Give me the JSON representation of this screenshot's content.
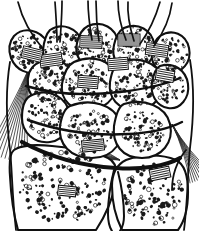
{
  "figure": {
    "title": "Carpal bones of the wrist",
    "style": "monochrome pen-and-ink anatomical line drawing with stippled trabecular bone shading",
    "background_color": "#ffffff",
    "ink_color": "#101010",
    "stipple_color": "#1a1a1a",
    "hatch_color": "#2b2b2b",
    "width_px": 199,
    "height_px": 231,
    "text_labels": [],
    "regions": [
      {
        "name": "metacarpal-shafts",
        "label": "Metacarpal shafts",
        "count": 5
      },
      {
        "name": "metacarpal-bases",
        "label": "Metacarpal bases",
        "count": 5
      },
      {
        "name": "distal-carpal-row",
        "label": "Distal carpal row",
        "count": 4
      },
      {
        "name": "proximal-carpal-row",
        "label": "Proximal carpal row",
        "count": 3
      },
      {
        "name": "radius",
        "label": "Distal radius",
        "count": 1
      },
      {
        "name": "ulna",
        "label": "Ulnar head",
        "count": 1
      },
      {
        "name": "radial-collateral-ligament",
        "label": "Radial collateral ligament fibers",
        "count": 1
      },
      {
        "name": "ulnar-collateral-ligament",
        "label": "Ulnar collateral ligament fibers",
        "count": 1
      },
      {
        "name": "interosseous-ligament-bands",
        "label": "Hatched interosseous ligament bands",
        "count": 9
      }
    ]
  },
  "shapes": {
    "metacarpal_shafts": [
      "M 18 2 C 22 18 30 34 44 50",
      "M 62 1 C 62 14 61 28 60 42",
      "M 88 1 C 88 14 90 28 92 40",
      "M 118 1 C 118 14 121 27 126 40",
      "M 160 2 C 156 16 150 30 140 44",
      "M 55 2 C 56 16 57 30 57 42",
      "M 96 1 C 96 14 97 28 99 41",
      "M 128 2 C 127 15 130 28 134 41",
      "M 172 3 C 170 18 164 32 154 46"
    ],
    "metacarpal_bases": [
      "M 14 36 C 24 26 40 30 47 42 C 53 52 50 66 40 71 C 28 76 16 70 11 58 C 8 49 9 42 14 36 Z",
      "M 50 30 C 62 22 78 28 82 42 C 86 56 78 70 64 72 C 50 74 42 62 43 50 C 44 41 46 34 50 30 Z",
      "M 88 26 C 102 20 116 28 118 42 C 120 56 110 68 96 68 C 82 68 74 56 77 43 C 79 34 82 29 88 26 Z",
      "M 124 28 C 138 22 152 30 154 44 C 156 58 146 70 132 70 C 118 70 111 58 114 45 C 116 36 119 31 124 28 Z",
      "M 160 36 C 172 28 186 34 189 48 C 192 62 182 74 168 73 C 156 72 150 62 152 50 C 154 42 156 39 160 36 Z"
    ],
    "distal_carpal_row": [
      "M 36 64 C 50 56 66 60 72 72 C 78 84 72 100 58 104 C 44 108 30 100 28 86 C 27 76 30 68 36 64 Z",
      "M 74 62 C 92 54 112 60 116 76 C 120 92 110 108 90 110 C 72 112 60 100 62 84 C 64 72 68 65 74 62 Z",
      "M 120 62 C 138 56 158 62 162 78 C 166 94 154 110 136 110 C 118 110 108 98 110 82 C 112 70 115 64 120 62 Z",
      "M 160 66 C 174 62 186 70 188 84 C 190 98 180 110 168 108 C 156 106 150 94 152 82 C 154 72 156 68 160 66 Z"
    ],
    "proximal_carpal_row": [
      "M 30 96 C 44 88 62 94 68 108 C 74 122 66 140 50 142 C 34 144 22 132 22 118 C 22 106 25 99 30 96 Z",
      "M 70 106 C 90 98 114 104 120 122 C 126 140 114 158 92 158 C 70 158 58 144 60 126 C 62 114 65 108 70 106 Z",
      "M 124 104 C 144 98 166 106 170 124 C 174 142 162 158 142 158 C 122 158 112 144 114 126 C 116 114 119 106 124 104 Z"
    ],
    "forearm_bones": [
      "M 14 150 C 20 146 34 144 52 146 C 74 148 96 152 108 158 C 116 162 118 170 116 182 C 112 202 104 218 96 230 L 18 230 C 14 216 11 196 10 176 C 9 162 10 153 14 150 Z",
      "M 126 160 C 142 154 162 154 176 160 C 184 164 188 176 188 192 C 188 208 184 222 178 230 L 122 230 C 116 218 112 202 112 186 C 112 172 118 164 126 160 Z"
    ],
    "joint_lines": [
      "M 22 142 C 48 156 80 166 116 168 C 142 170 166 166 180 158",
      "M 26 86 C 52 94 86 96 120 92 C 146 89 166 84 180 78",
      "M 28 120 C 56 130 92 136 128 134 C 152 133 170 128 182 122"
    ],
    "outer_contours": [
      "M 10 62 C 6 86 6 118 10 150 C 12 166 12 196 16 230",
      "M 190 60 C 194 84 194 116 190 148 C 188 164 188 198 184 230",
      "M 186 150 C 178 160 172 174 172 190"
    ],
    "notch": [
      "M 114 170 C 110 186 108 202 108 214 C 108 222 110 228 112 231",
      "M 118 172 C 122 188 124 204 124 216 C 124 224 122 228 120 231"
    ],
    "ligament_fans": {
      "radial": {
        "cx": 30,
        "cy": 66,
        "count": 12,
        "spread": 26,
        "length": 96,
        "angle": 104
      },
      "ulnar": {
        "cx": 172,
        "cy": 124,
        "count": 10,
        "spread": 22,
        "length": 62,
        "angle": 62
      },
      "palmar_sweep": {
        "cx": 120,
        "cy": 160,
        "count": 9,
        "spread": 18,
        "length": 58,
        "angle": 196
      }
    },
    "hatch_bands": [
      {
        "x": 40,
        "y": 54,
        "w": 22,
        "h": 12,
        "angle": -8,
        "lines": 6
      },
      {
        "x": 80,
        "y": 36,
        "w": 22,
        "h": 12,
        "angle": 2,
        "lines": 6
      },
      {
        "x": 118,
        "y": 34,
        "w": 22,
        "h": 12,
        "angle": 0,
        "lines": 6
      },
      {
        "x": 146,
        "y": 44,
        "w": 22,
        "h": 12,
        "angle": 8,
        "lines": 6
      },
      {
        "x": 108,
        "y": 58,
        "w": 20,
        "h": 12,
        "angle": -4,
        "lines": 6
      },
      {
        "x": 78,
        "y": 76,
        "w": 20,
        "h": 12,
        "angle": 4,
        "lines": 6
      },
      {
        "x": 156,
        "y": 70,
        "w": 18,
        "h": 11,
        "angle": 10,
        "lines": 5
      },
      {
        "x": 82,
        "y": 140,
        "w": 22,
        "h": 11,
        "angle": -6,
        "lines": 6
      },
      {
        "x": 22,
        "y": 48,
        "w": 20,
        "h": 12,
        "angle": 14,
        "lines": 6
      },
      {
        "x": 58,
        "y": 186,
        "w": 18,
        "h": 10,
        "angle": 6,
        "lines": 5
      },
      {
        "x": 150,
        "y": 168,
        "w": 20,
        "h": 11,
        "angle": -12,
        "lines": 5
      }
    ],
    "stipple_fields": [
      {
        "name": "mc-base-1",
        "cx": 29,
        "cy": 52,
        "rx": 17,
        "ry": 18,
        "n": 62,
        "min": 0.7,
        "max": 1.9
      },
      {
        "name": "mc-base-2",
        "cx": 63,
        "cy": 48,
        "rx": 18,
        "ry": 20,
        "n": 70,
        "min": 0.7,
        "max": 2.0
      },
      {
        "name": "mc-base-3",
        "cx": 97,
        "cy": 45,
        "rx": 18,
        "ry": 20,
        "n": 70,
        "min": 0.7,
        "max": 2.0
      },
      {
        "name": "mc-base-4",
        "cx": 134,
        "cy": 47,
        "rx": 18,
        "ry": 20,
        "n": 70,
        "min": 0.7,
        "max": 2.0
      },
      {
        "name": "mc-base-5",
        "cx": 170,
        "cy": 54,
        "rx": 17,
        "ry": 18,
        "n": 62,
        "min": 0.7,
        "max": 1.9
      },
      {
        "name": "carpal-d1",
        "cx": 50,
        "cy": 84,
        "rx": 17,
        "ry": 18,
        "n": 64,
        "min": 0.7,
        "max": 2.0
      },
      {
        "name": "carpal-d2",
        "cx": 90,
        "cy": 84,
        "rx": 22,
        "ry": 21,
        "n": 86,
        "min": 0.7,
        "max": 2.1
      },
      {
        "name": "carpal-d3",
        "cx": 135,
        "cy": 86,
        "rx": 22,
        "ry": 21,
        "n": 86,
        "min": 0.7,
        "max": 2.1
      },
      {
        "name": "carpal-d4",
        "cx": 170,
        "cy": 87,
        "rx": 14,
        "ry": 17,
        "n": 50,
        "min": 0.7,
        "max": 1.9
      },
      {
        "name": "carpal-p1",
        "cx": 45,
        "cy": 118,
        "rx": 17,
        "ry": 20,
        "n": 66,
        "min": 0.7,
        "max": 2.0
      },
      {
        "name": "carpal-p2",
        "cx": 90,
        "cy": 131,
        "rx": 24,
        "ry": 21,
        "n": 92,
        "min": 0.7,
        "max": 2.1
      },
      {
        "name": "carpal-p3",
        "cx": 142,
        "cy": 131,
        "rx": 22,
        "ry": 21,
        "n": 84,
        "min": 0.7,
        "max": 2.1
      },
      {
        "name": "radius-body",
        "cx": 62,
        "cy": 186,
        "rx": 44,
        "ry": 36,
        "n": 150,
        "min": 0.9,
        "max": 2.4
      },
      {
        "name": "ulna-body",
        "cx": 154,
        "cy": 194,
        "rx": 30,
        "ry": 32,
        "n": 100,
        "min": 0.9,
        "max": 2.4
      }
    ]
  }
}
